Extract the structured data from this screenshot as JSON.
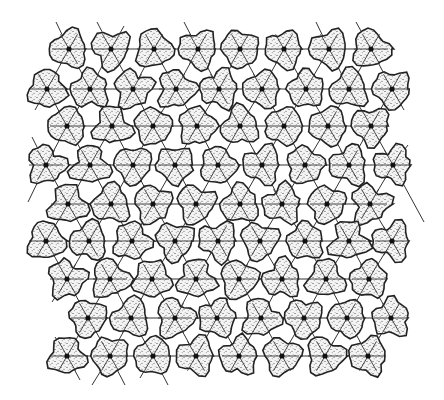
{
  "figure": {
    "type": "hexagonal-lattice-diagram",
    "colors": {
      "background": "#ffffff",
      "outline": "#222222",
      "stipple": "#333333",
      "cell_fill": "#e8e8e8"
    },
    "cell_radius": 20,
    "rows": [
      {
        "y": 49,
        "xs": [
          69,
          111,
          154,
          198,
          240,
          284,
          329,
          371
        ]
      },
      {
        "y": 89,
        "xs": [
          47,
          90,
          133,
          176,
          219,
          262,
          306,
          349,
          392
        ]
      },
      {
        "y": 126,
        "xs": [
          67,
          112,
          153,
          197,
          240,
          284,
          328,
          371
        ]
      },
      {
        "y": 165,
        "xs": [
          46,
          90,
          133,
          175,
          218,
          262,
          305,
          349,
          393
        ]
      },
      {
        "y": 204,
        "xs": [
          68,
          111,
          153,
          196,
          240,
          282,
          327,
          370
        ]
      },
      {
        "y": 241,
        "xs": [
          46,
          89,
          132,
          175,
          218,
          260,
          305,
          349,
          392
        ]
      },
      {
        "y": 279,
        "xs": [
          67,
          110,
          152,
          196,
          239,
          282,
          326,
          369
        ]
      },
      {
        "y": 318,
        "xs": [
          88,
          131,
          175,
          217,
          261,
          304,
          347,
          391
        ]
      },
      {
        "y": 356,
        "xs": [
          67,
          110,
          153,
          196,
          239,
          282,
          325,
          368
        ]
      }
    ],
    "edge_lines": [
      [
        56,
        22,
        69,
        49
      ],
      [
        78,
        30,
        69,
        49
      ],
      [
        97,
        22,
        111,
        49
      ],
      [
        124,
        26,
        111,
        49
      ],
      [
        184,
        22,
        198,
        49
      ],
      [
        316,
        22,
        329,
        49
      ],
      [
        356,
        22,
        371,
        49
      ],
      [
        35,
        110,
        47,
        89
      ],
      [
        404,
        72,
        392,
        89
      ],
      [
        404,
        110,
        392,
        89
      ],
      [
        32,
        137,
        46,
        165
      ],
      [
        408,
        145,
        393,
        165
      ],
      [
        28,
        202,
        46,
        165
      ],
      [
        424,
        222,
        393,
        165
      ],
      [
        52,
        302,
        67,
        279
      ],
      [
        55,
        337,
        67,
        356
      ],
      [
        80,
        380,
        67,
        356
      ],
      [
        92,
        385,
        110,
        356
      ],
      [
        125,
        385,
        110,
        356
      ],
      [
        140,
        378,
        153,
        356
      ],
      [
        168,
        385,
        153,
        356
      ]
    ]
  }
}
